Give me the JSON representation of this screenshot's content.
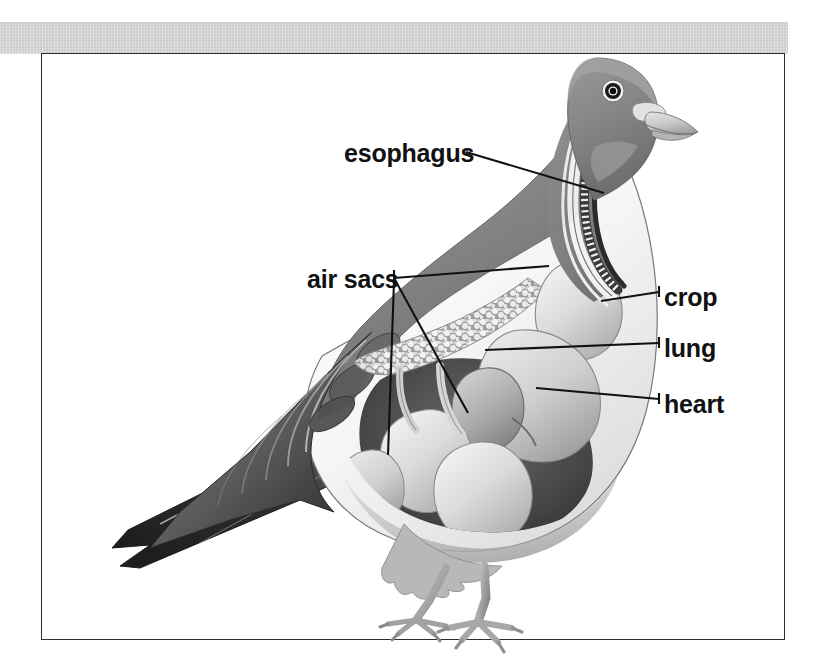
{
  "page": {
    "background_color": "#ffffff",
    "header_band_color": "#c9c9c9",
    "frame_border_color": "#2e2e2e"
  },
  "figure": {
    "illustration_colors": {
      "plumage_dark": "#8a8a8a",
      "plumage_wing_dark": "#3d3d3d",
      "breast_light": "#f2f2f2",
      "organ_light": "#dcdcdc",
      "organ_mid": "#b4b4b4",
      "cavity_dark": "#4a4a4a",
      "outline": "#555555",
      "leg_color": "#a9a9a9",
      "eye_color": "#101010",
      "beak_color": "#cfcfcf"
    }
  },
  "labels": [
    {
      "id": "esophagus",
      "text": "esophagus",
      "text_x": 344,
      "text_y": 162,
      "anchor": "start",
      "leader": "M 466 152 L 604 193"
    },
    {
      "id": "air-sacs",
      "text": "air sacs",
      "text_x": 307,
      "text_y": 288,
      "anchor": "start",
      "leader": "M 394 278 L 549 266 M 394 278 L 468 413 M 394 281 L 388 455"
    },
    {
      "id": "crop",
      "text": "crop",
      "text_x": 664,
      "text_y": 306,
      "anchor": "start",
      "leader": "M 601 301 L 659 292",
      "tick": "M 659 286 L 659 297"
    },
    {
      "id": "lung",
      "text": "lung",
      "text_x": 664,
      "text_y": 357,
      "anchor": "start",
      "leader": "M 485 350 L 659 343",
      "tick": "M 659 337 L 659 348"
    },
    {
      "id": "heart",
      "text": "heart",
      "text_x": 664,
      "text_y": 413,
      "anchor": "start",
      "leader": "M 536 388 L 659 399",
      "tick": "M 659 393 L 659 404"
    }
  ]
}
